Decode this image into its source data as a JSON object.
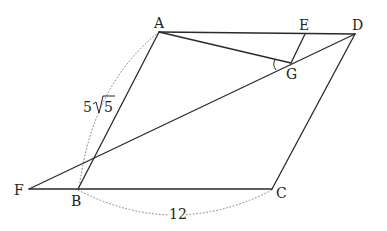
{
  "figure": {
    "type": "parallelogram-geometry",
    "points": {
      "A": {
        "label": "A",
        "x": 159,
        "y": 32
      },
      "B": {
        "label": "B",
        "x": 78,
        "y": 189
      },
      "C": {
        "label": "C",
        "x": 272,
        "y": 189
      },
      "D": {
        "label": "D",
        "x": 355,
        "y": 34
      },
      "E": {
        "label": "E",
        "x": 305,
        "y": 34
      },
      "F": {
        "label": "F",
        "x": 29,
        "y": 189
      },
      "G": {
        "label": "G",
        "x": 291,
        "y": 63
      }
    },
    "segments": [
      [
        "A",
        "B"
      ],
      [
        "B",
        "C"
      ],
      [
        "C",
        "D"
      ],
      [
        "D",
        "A"
      ],
      [
        "F",
        "B"
      ],
      [
        "F",
        "D"
      ],
      [
        "A",
        "G"
      ],
      [
        "E",
        "G"
      ]
    ],
    "measurements": {
      "AB": "5√5",
      "AB_coef": "5",
      "AB_rad": "5",
      "BC": "12"
    },
    "marked_angle": "AGF"
  }
}
